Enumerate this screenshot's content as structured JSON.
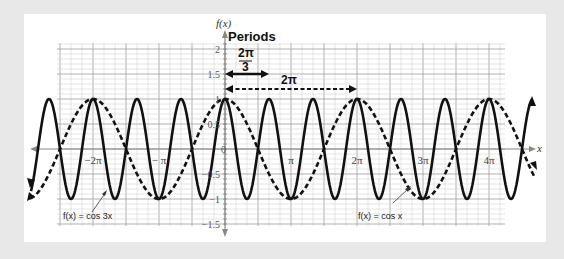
{
  "chart_data": {
    "type": "line",
    "title": "Periods",
    "xlabel": "x",
    "ylabel": "f(x)",
    "xlim": [
      -11.0,
      14.4
    ],
    "ylim": [
      -1.5,
      2
    ],
    "grid": true,
    "x_tick_labels": [
      "−2π",
      "− π",
      "π",
      "2π",
      "3π",
      "4π"
    ],
    "y_tick_labels": [
      "2",
      "1.5",
      "1",
      "0.5",
      "0",
      "−0.5",
      "−1",
      "−1.5"
    ],
    "series": [
      {
        "name": "f(x) = cos 3x",
        "style": "solid",
        "function": "cos(3x)",
        "amplitude": 1,
        "period": "2π/3"
      },
      {
        "name": "f(x) = cos x",
        "style": "dashed",
        "function": "cos(x)",
        "amplitude": 1,
        "period": "2π"
      }
    ],
    "annotations": [
      {
        "text": "2π/3",
        "type": "double-arrow",
        "style": "solid",
        "from": 0,
        "to": 2.094,
        "y": 1.5
      },
      {
        "text": "2π",
        "type": "double-arrow",
        "style": "dashed",
        "from": 0,
        "to": 6.283,
        "y": 1.2
      }
    ]
  },
  "labels": {
    "y_axis": "f(x)",
    "x_axis": "x",
    "title": "Periods",
    "period_small_num": "2π",
    "period_small_den": "3",
    "period_large": "2π",
    "legend_cos3x": "f(x) = cos 3x",
    "legend_cosx": "f(x) = cos x",
    "origin": "0"
  },
  "x_ticks": [
    {
      "label": "−2π",
      "px": 93
    },
    {
      "label": "− π",
      "px": 159
    },
    {
      "label": "π",
      "px": 291
    },
    {
      "label": "2π",
      "px": 357
    },
    {
      "label": "3π",
      "px": 423
    },
    {
      "label": "4π",
      "px": 489
    }
  ],
  "y_ticks": [
    {
      "label": "2",
      "py": 49
    },
    {
      "label": "1.5",
      "py": 74
    },
    {
      "label": "1",
      "py": 99
    },
    {
      "label": "0.5",
      "py": 124
    },
    {
      "label": "−0.5",
      "py": 174
    },
    {
      "label": "−1",
      "py": 199
    },
    {
      "label": "−1.5",
      "py": 224
    }
  ]
}
